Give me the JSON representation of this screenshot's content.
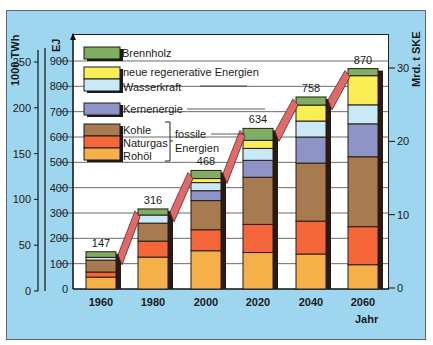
{
  "chart_data": {
    "type": "bar",
    "stacked": true,
    "title": "",
    "xlabel": "Jahr",
    "ylabel": "EJ",
    "ylabel_left_outer": "1000 TWh",
    "ylabel_right": "Mrd. t SKE",
    "ylim": [
      0,
      900
    ],
    "grid": true,
    "legend_position": "inside top-left",
    "categories": [
      "1960",
      "1980",
      "2000",
      "2020",
      "2040",
      "2060"
    ],
    "totals": [
      147,
      316,
      468,
      634,
      758,
      870
    ],
    "series": [
      {
        "name": "Rohöl",
        "group": "fossile Energien",
        "color": "#f6b04a",
        "values": [
          47,
          126,
          151,
          144,
          138,
          96
        ]
      },
      {
        "name": "Naturgas",
        "group": "fossile Energien",
        "color": "#f5673a",
        "values": [
          20,
          63,
          83,
          111,
          130,
          150
        ]
      },
      {
        "name": "Kohle",
        "group": "fossile Energien",
        "color": "#a77a4f",
        "values": [
          47,
          71,
          115,
          186,
          229,
          276
        ]
      },
      {
        "name": "Kernenergie",
        "color": "#8f94c8",
        "values": [
          0,
          0,
          39,
          67,
          103,
          130
        ]
      },
      {
        "name": "Wasserkraft",
        "color": "#c8e9f5",
        "values": [
          11,
          32,
          32,
          47,
          63,
          75
        ]
      },
      {
        "name": "neue regenerative Energien",
        "color": "#f9ee55",
        "values": [
          0,
          0,
          16,
          32,
          63,
          115
        ]
      },
      {
        "name": "Brennholz",
        "color": "#7fae62",
        "values": [
          22,
          24,
          32,
          47,
          32,
          28
        ]
      }
    ],
    "axes": {
      "left_outer": {
        "label": "1000 TWh",
        "ticks": [
          0,
          50,
          100,
          150,
          200,
          250
        ]
      },
      "left_inner": {
        "label": "EJ",
        "ticks": [
          0,
          100,
          200,
          300,
          400,
          500,
          600,
          700,
          800,
          900
        ]
      },
      "right": {
        "label": "Mrd. t SKE",
        "ticks": [
          0,
          10,
          20,
          30
        ]
      }
    },
    "annotations": [
      "fossile Energien"
    ]
  },
  "legend": {
    "brennholz": "Brennholz",
    "neue": "neue regenerative Energien",
    "wasser": "Wasserkraft",
    "kern": "Kernenergie",
    "kohle": "Kohle",
    "gas": "Naturgas",
    "oel": "Rohöl",
    "fossil_1": "fossile",
    "fossil_2": "Energien"
  },
  "labels": {
    "twh": "1000 TWh",
    "ej": "EJ",
    "ske": "Mrd. t SKE",
    "jahr": "Jahr"
  }
}
